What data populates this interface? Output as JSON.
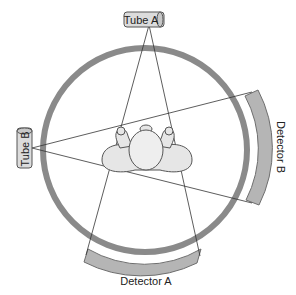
{
  "diagram": {
    "tube_a": {
      "label": "Tube A"
    },
    "tube_b": {
      "label": "Tube B"
    },
    "detector_a": {
      "label": "Detector A"
    },
    "detector_b": {
      "label": "Detector B"
    },
    "gantry": {
      "name": "gantry-ring"
    },
    "patient": {
      "name": "patient-top-view"
    },
    "colors": {
      "ring": "#8a8a8a",
      "detector": "#b5b5b5",
      "detector_stroke": "#6e6e6e",
      "tube_fill": "#dcdcdc",
      "beam": "#333333",
      "patient_fill": "#e6e6e6",
      "patient_stroke": "#555555"
    }
  }
}
